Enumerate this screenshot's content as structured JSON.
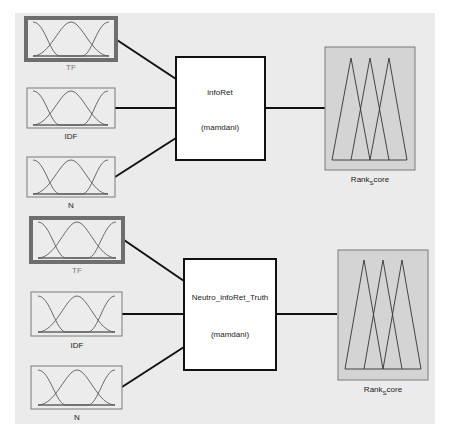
{
  "diagrams": [
    {
      "name": "infoRet",
      "inputs": [
        {
          "label": "TF",
          "selected": true
        },
        {
          "label": "IDF",
          "selected": false
        },
        {
          "label": "N",
          "selected": false
        }
      ],
      "fis": {
        "name": "infoRet",
        "type": "(mamdani)"
      },
      "output": {
        "label_main": "Rank",
        "label_sub": "S",
        "label_tail": "core"
      }
    },
    {
      "name": "Neutro_infoRet_Truth",
      "inputs": [
        {
          "label": "TF",
          "selected": true
        },
        {
          "label": "IDF",
          "selected": false
        },
        {
          "label": "N",
          "selected": false
        }
      ],
      "fis": {
        "name": "Neutro_infoRet_Truth",
        "type": "(mamdani)"
      },
      "output": {
        "label_main": "Rank",
        "label_sub": "S",
        "label_tail": "core"
      }
    }
  ],
  "colors": {
    "background": "#ebebeb",
    "input_border": "#7a7a7a",
    "output_fill": "#d4d4d4",
    "wire": "#111111"
  }
}
